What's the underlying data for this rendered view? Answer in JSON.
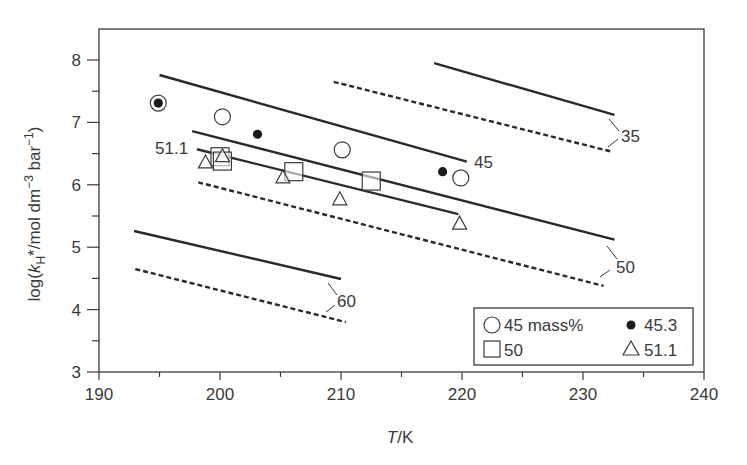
{
  "chart_data": {
    "type": "line",
    "title": "",
    "xlabel": "T/K",
    "ylabel": "log(kH*/mol dm^-3 bar^-1)",
    "xlim": [
      190,
      240
    ],
    "ylim": [
      3,
      8.5
    ],
    "x_ticks": [
      190,
      200,
      210,
      220,
      230,
      240
    ],
    "y_ticks": [
      3,
      4,
      5,
      6,
      7,
      8
    ],
    "grid": false,
    "legend_position": "lower right",
    "lines": [
      {
        "label": "35",
        "style": "solid",
        "x": [
          217.7,
          232.6
        ],
        "y": [
          7.95,
          7.12
        ]
      },
      {
        "label": "35",
        "style": "dashed",
        "x": [
          209.4,
          232.4
        ],
        "y": [
          7.65,
          6.53
        ]
      },
      {
        "label": "45",
        "style": "solid",
        "x": [
          195.0,
          220.4
        ],
        "y": [
          7.76,
          6.37
        ]
      },
      {
        "label": "50",
        "style": "solid",
        "x": [
          197.7,
          232.6
        ],
        "y": [
          6.86,
          5.12
        ]
      },
      {
        "label": "51.1",
        "style": "solid",
        "x": [
          198.1,
          219.7
        ],
        "y": [
          6.57,
          5.53
        ]
      },
      {
        "label": "50",
        "style": "dashed",
        "x": [
          198.2,
          231.7
        ],
        "y": [
          6.04,
          4.38
        ]
      },
      {
        "label": "60",
        "style": "solid",
        "x": [
          192.9,
          210.0
        ],
        "y": [
          5.26,
          4.49
        ]
      },
      {
        "label": "60",
        "style": "dashed",
        "x": [
          193.0,
          210.4
        ],
        "y": [
          4.65,
          3.8
        ]
      }
    ],
    "series": [
      {
        "name": "45 mass%",
        "marker": "open-circle",
        "x": [
          194.9,
          200.2,
          210.1,
          219.9
        ],
        "y": [
          7.31,
          7.09,
          6.56,
          6.11
        ]
      },
      {
        "name": "45.3",
        "marker": "filled-circle",
        "x": [
          194.9,
          203.1,
          218.4
        ],
        "y": [
          7.31,
          6.81,
          6.21
        ]
      },
      {
        "name": "50",
        "marker": "open-square",
        "x": [
          200.0,
          200.2,
          206.1,
          212.5
        ],
        "y": [
          6.45,
          6.38,
          6.21,
          6.06
        ]
      },
      {
        "name": "51.1",
        "marker": "open-triangle",
        "x": [
          198.8,
          200.2,
          205.2,
          209.9,
          219.8
        ],
        "y": [
          6.35,
          6.45,
          6.11,
          5.76,
          5.37
        ]
      }
    ],
    "annotations": [
      "35",
      "45",
      "50",
      "51.1",
      "60"
    ]
  },
  "axes": {
    "x_title_italic": "T",
    "x_title_rest": "/K",
    "y_title_pre": "log(",
    "y_title_k": "k",
    "y_title_sub": "H",
    "y_title_mid": "*/mol dm",
    "y_title_sup1": "−3",
    "y_title_mid2": " bar",
    "y_title_sup2": "−1",
    "y_title_post": ")"
  },
  "legend": {
    "items": [
      {
        "label": "45 mass%",
        "marker": "open-circle"
      },
      {
        "label": "45.3",
        "marker": "filled-circle"
      },
      {
        "label": "50",
        "marker": "open-square"
      },
      {
        "label": "51.1",
        "marker": "open-triangle"
      }
    ]
  },
  "colors": {
    "ink": "#2a2a2a",
    "axis": "#3a3a3a",
    "background": "#ffffff"
  }
}
